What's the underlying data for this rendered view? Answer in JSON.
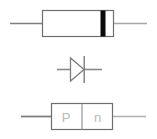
{
  "figure": {
    "background_color": "#ffffff",
    "width": 157,
    "height": 139
  },
  "colors": {
    "outline": "#5a5a5a",
    "body_outline": "#6e6e6e",
    "lead_dark": "#7a7a7a",
    "lead_light": "#b0b0b0",
    "cathode_band": "#0a0a0a",
    "label_text": "#b9b9b9",
    "symbol_stroke": "#7d7d7d"
  },
  "items": [
    {
      "id": "physical-diode",
      "name": "physical-diode-package",
      "description": "Axial diode package with cathode band near right end",
      "body": {
        "x": 42,
        "y": 10,
        "width": 72,
        "height": 26
      },
      "cathode_band": {
        "x": 101,
        "y": 10,
        "width": 5,
        "height": 26
      },
      "leads": [
        {
          "side": "anode",
          "x1": 10,
          "x2": 42,
          "y": 23
        },
        {
          "side": "cathode",
          "x1": 114,
          "x2": 147,
          "y": 23
        }
      ]
    },
    {
      "id": "diode-symbol",
      "name": "diode-schematic-symbol",
      "description": "Triangle pointing right into a vertical cathode bar",
      "triangle": {
        "x1": 70,
        "y1": 58,
        "x2": 70,
        "y2": 80,
        "apex_x": 84,
        "apex_y": 69
      },
      "cathode_bar": {
        "x": 84,
        "y1": 56,
        "y2": 82
      },
      "leads": [
        {
          "side": "anode",
          "x1": 57,
          "x2": 70,
          "y": 69
        },
        {
          "side": "cathode",
          "x1": 84,
          "x2": 102,
          "y": 69
        }
      ]
    },
    {
      "id": "pn-junction",
      "name": "pn-junction-diagram",
      "description": "Rectangular block split into P region and n region",
      "box": {
        "x": 51,
        "y": 103,
        "width": 62,
        "height": 26
      },
      "divider_x": 82,
      "regions": [
        {
          "key": "p_region",
          "label": "P"
        },
        {
          "key": "n_region",
          "label": "n"
        }
      ],
      "leads": [
        {
          "side": "anode",
          "x1": 21,
          "x2": 51,
          "y": 116
        },
        {
          "side": "cathode",
          "x1": 113,
          "x2": 146,
          "y": 116
        }
      ]
    }
  ],
  "labels": {
    "p_region": "P",
    "n_region": "n"
  }
}
